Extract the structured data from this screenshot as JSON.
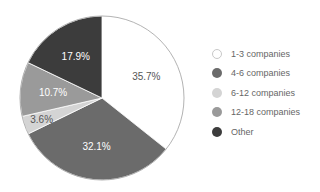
{
  "chart_data": {
    "type": "pie",
    "title": "",
    "categories": [
      "1-3 companies",
      "4-6 companies",
      "6-12 companies",
      "12-18 companies",
      "Other"
    ],
    "values": [
      35.7,
      32.1,
      3.6,
      10.7,
      17.9
    ],
    "labels": [
      "35.7%",
      "32.1%",
      "3.6%",
      "10.7%",
      "17.9%"
    ],
    "colors": [
      "#ffffff",
      "#6b6b6b",
      "#d4d4d4",
      "#9a9a9a",
      "#3c3c3c"
    ],
    "label_colors": [
      "#555555",
      "#ffffff",
      "#555555",
      "#ffffff",
      "#ffffff"
    ],
    "start_angle": "12 o'clock",
    "direction": "clockwise",
    "legend_position": "right"
  },
  "legend": {
    "items": [
      {
        "label": "1-3 companies",
        "color": "#ffffff"
      },
      {
        "label": "4-6 companies",
        "color": "#6b6b6b"
      },
      {
        "label": "6-12 companies",
        "color": "#d4d4d4"
      },
      {
        "label": "12-18 companies",
        "color": "#9a9a9a"
      },
      {
        "label": "Other",
        "color": "#3c3c3c"
      }
    ]
  }
}
